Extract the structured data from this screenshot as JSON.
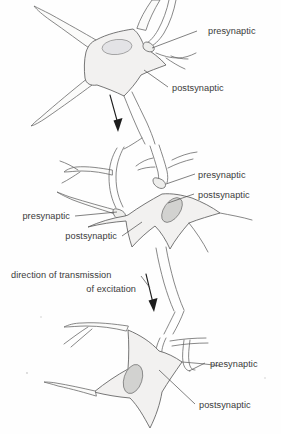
{
  "figure": {
    "background_color": "#fefefe",
    "line_color": "#5e5e5e",
    "soma_fill": "#f2f1f0",
    "nucleus_fill": "#d2d2d0",
    "text_color": "#3b3b3b",
    "arrow_color": "#1d1d1d"
  },
  "labels": {
    "top_presynaptic": "presynaptic",
    "top_postsynaptic": "postsynaptic",
    "mid_right_presynaptic": "presynaptic",
    "mid_right_postsynaptic": "postsynaptic",
    "mid_left_presynaptic": "presynaptic",
    "mid_left_postsynaptic": "postsynaptic",
    "direction_line1": "direction of transmission",
    "direction_line2": "of excitation",
    "bottom_presynaptic": "presynaptic",
    "bottom_postsynaptic": "postsynaptic"
  },
  "neurons": [
    {
      "name": "top-neuron",
      "position": "upper",
      "nucleus": "visible",
      "labels": [
        "presynaptic",
        "postsynaptic"
      ]
    },
    {
      "name": "middle-neuron",
      "position": "middle",
      "nucleus": "visible",
      "labels": [
        "presynaptic",
        "postsynaptic",
        "presynaptic",
        "postsynaptic"
      ]
    },
    {
      "name": "bottom-neuron",
      "position": "lower",
      "nucleus": "visible",
      "labels": [
        "presynaptic",
        "postsynaptic"
      ]
    }
  ],
  "arrows": [
    {
      "name": "transmission-arrow-top",
      "direction": "down"
    },
    {
      "name": "transmission-arrow-middle",
      "direction": "down"
    }
  ]
}
